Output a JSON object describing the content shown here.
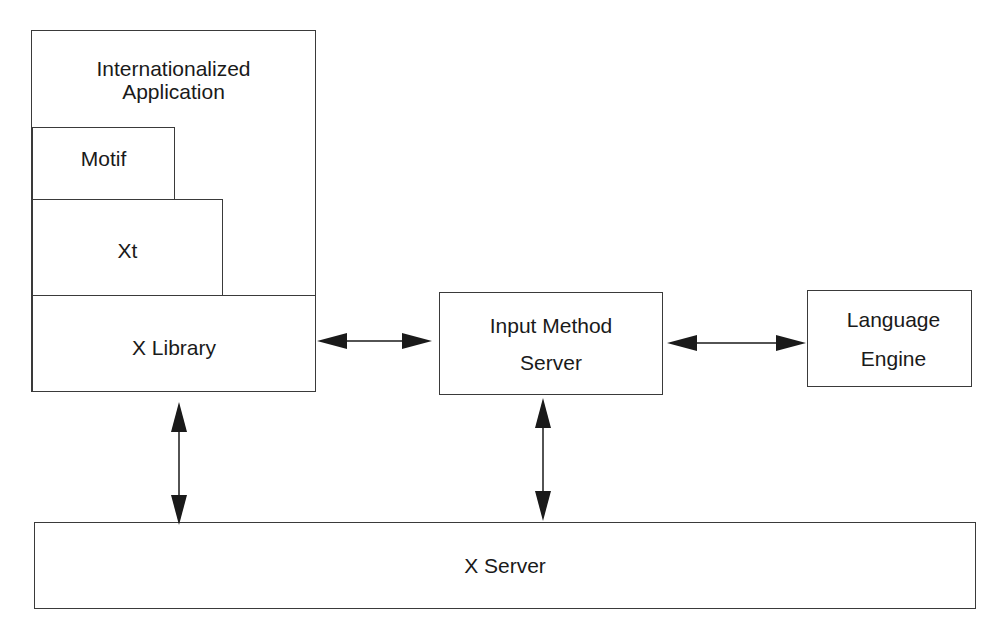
{
  "diagram": {
    "nodes": {
      "application": {
        "line1": "Internationalized",
        "line2": "Application"
      },
      "motif": {
        "label": "Motif"
      },
      "xt": {
        "label": "Xt"
      },
      "xlib": {
        "label": "X Library"
      },
      "ims": {
        "line1": "Input Method",
        "line2": "Server"
      },
      "engine": {
        "line1": "Language",
        "line2": "Engine"
      },
      "xserver": {
        "label": "X Server"
      }
    },
    "edges": [
      {
        "from": "X Library",
        "to": "Input Method Server",
        "direction": "bidirectional"
      },
      {
        "from": "Input Method Server",
        "to": "Language Engine",
        "direction": "bidirectional"
      },
      {
        "from": "X Library",
        "to": "X Server",
        "direction": "bidirectional"
      },
      {
        "from": "Input Method Server",
        "to": "X Server",
        "direction": "bidirectional"
      }
    ],
    "colors": {
      "stroke": "#3a3a3a",
      "text": "#1a1a1a",
      "background": "#ffffff"
    }
  }
}
